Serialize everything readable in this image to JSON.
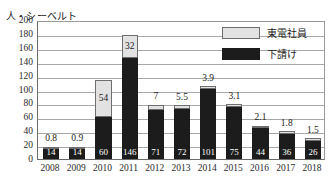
{
  "chart_data": {
    "type": "bar",
    "subtype": "stacked-bar",
    "title": "",
    "subtitle": "",
    "xlabel": "",
    "ylabel": "人・シーベルト",
    "ylim": [
      0,
      200
    ],
    "ytick_step": 20,
    "yticks": [
      "200",
      "180",
      "160",
      "140",
      "120",
      "100",
      "80",
      "60",
      "40",
      "20",
      "0"
    ],
    "grid": true,
    "legend_position": "top-right",
    "categories": [
      "2008",
      "2009",
      "2010",
      "2011",
      "2012",
      "2013",
      "2014",
      "2015",
      "2016",
      "2017",
      "2018"
    ],
    "series": [
      {
        "name": "下請け",
        "color": "#1c1c1c",
        "stack_position": "lower",
        "values": [
          14,
          14,
          60,
          146,
          71,
          72,
          101,
          75,
          44,
          36,
          26
        ],
        "labels": [
          "14",
          "14",
          "60",
          "146",
          "71",
          "72",
          "101",
          "75",
          "44",
          "36",
          "26"
        ]
      },
      {
        "name": "東電社員",
        "color": "#e2e2e2",
        "stack_position": "upper",
        "values": [
          0.8,
          0.9,
          54,
          32,
          7,
          5.5,
          3.9,
          3.1,
          2.1,
          1.8,
          1.5
        ],
        "labels": [
          "0.8",
          "0.9",
          "54",
          "32",
          "7",
          "5.5",
          "3.9",
          "3.1",
          "2.1",
          "1.8",
          "1.5"
        ]
      }
    ],
    "totals": [
      14.8,
      14.9,
      114,
      178,
      78,
      77.5,
      104.9,
      78.1,
      46.1,
      37.8,
      27.5
    ]
  },
  "legend": {
    "items": [
      {
        "label": "東電社員",
        "swatch": "light"
      },
      {
        "label": "下請け",
        "swatch": "dark"
      }
    ]
  },
  "axis": {
    "y_unit": "人・シーベルト"
  }
}
